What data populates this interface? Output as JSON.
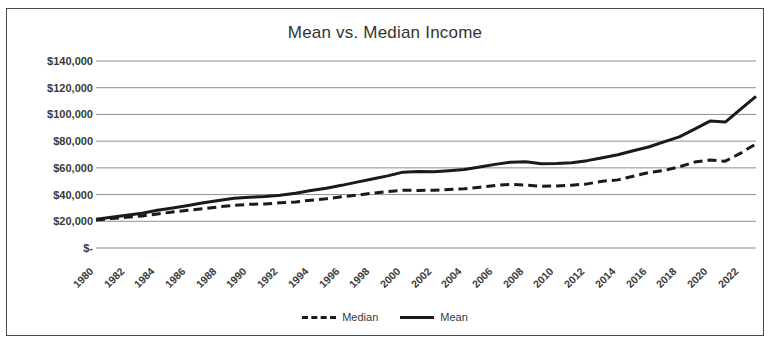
{
  "chart_data": {
    "type": "line",
    "title": "Mean vs. Median Income",
    "xlabel": "",
    "ylabel": "",
    "grid": true,
    "legend_position": "bottom",
    "ylim": [
      0,
      140000
    ],
    "ytick_labels": [
      "$140,000",
      "$120,000",
      "$100,000",
      "$80,000",
      "$60,000",
      "$40,000",
      "$20,000",
      "$-"
    ],
    "ytick_values": [
      140000,
      120000,
      100000,
      80000,
      60000,
      40000,
      20000,
      0
    ],
    "xlim": [
      1980,
      2023
    ],
    "xtick_labels": [
      "1980",
      "1982",
      "1984",
      "1986",
      "1988",
      "1990",
      "1992",
      "1994",
      "1996",
      "1998",
      "2000",
      "2002",
      "2004",
      "2006",
      "2008",
      "2010",
      "2012",
      "2014",
      "2016",
      "2018",
      "2020",
      "2022"
    ],
    "x": [
      1980,
      1981,
      1982,
      1983,
      1984,
      1985,
      1986,
      1987,
      1988,
      1989,
      1990,
      1991,
      1992,
      1993,
      1994,
      1995,
      1996,
      1997,
      1998,
      1999,
      2000,
      2001,
      2002,
      2003,
      2004,
      2005,
      2006,
      2007,
      2008,
      2009,
      2010,
      2011,
      2012,
      2013,
      2014,
      2015,
      2016,
      2017,
      2018,
      2019,
      2020,
      2021,
      2022,
      2023
    ],
    "series": [
      {
        "name": "Median",
        "style": "dashed",
        "color": "#1a1a1a",
        "values": [
          21000,
          22000,
          23000,
          24000,
          25500,
          27000,
          28200,
          29500,
          30800,
          32000,
          32700,
          33000,
          33800,
          34500,
          35800,
          36900,
          38300,
          39600,
          41000,
          42300,
          43200,
          43100,
          43200,
          43800,
          44400,
          45500,
          46800,
          47700,
          47100,
          46300,
          46500,
          47000,
          48000,
          50000,
          51000,
          53700,
          56500,
          58000,
          60800,
          64300,
          65800,
          65000,
          71000,
          78000
        ]
      },
      {
        "name": "Mean",
        "style": "solid",
        "color": "#1a1a1a",
        "values": [
          21500,
          23000,
          24500,
          26000,
          28200,
          30000,
          31800,
          33800,
          35500,
          37200,
          38000,
          38500,
          39500,
          41000,
          43000,
          44800,
          46900,
          49300,
          51600,
          54000,
          56800,
          57200,
          57000,
          57800,
          58800,
          60600,
          62600,
          64200,
          64500,
          63100,
          63200,
          63800,
          65400,
          67600,
          69800,
          72800,
          75600,
          79500,
          83200,
          89000,
          95000,
          94300,
          104000,
          113500
        ]
      }
    ]
  },
  "legend": {
    "items": [
      {
        "label": "Median",
        "style": "dashed"
      },
      {
        "label": "Mean",
        "style": "solid"
      }
    ]
  }
}
